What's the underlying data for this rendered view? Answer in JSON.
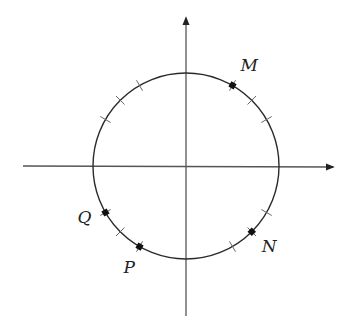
{
  "diagram": {
    "type": "unit-circle",
    "axes": {
      "x_arrow": true,
      "y_arrow": true
    },
    "tick_angles_deg": [
      30,
      45,
      120,
      135,
      150,
      225,
      300,
      330
    ],
    "points": [
      {
        "label": "M",
        "angle_deg": 60
      },
      {
        "label": "N",
        "angle_deg": 315
      },
      {
        "label": "P",
        "angle_deg": 240
      },
      {
        "label": "Q",
        "angle_deg": 210
      }
    ],
    "colors": {
      "stroke": "#2a2a2a",
      "point": "#111111"
    }
  }
}
